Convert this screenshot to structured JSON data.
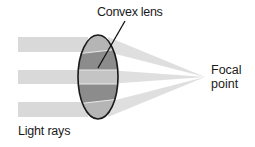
{
  "diagram": {
    "type": "optics-convex-lens",
    "labels": {
      "lens": "Convex lens",
      "focal_line1": "Focal",
      "focal_line2": "point",
      "rays": "Light rays"
    },
    "colors": {
      "ray": "#d9d9d9",
      "lens_outline": "#1a1a1a",
      "lens_dark": "#8c8c8c",
      "lens_mid": "#a6a6a6",
      "lens_light": "#c4c4c4",
      "background": "#ffffff"
    },
    "rays": [
      {
        "name": "top",
        "y_top": 37,
        "y_bottom": 52
      },
      {
        "name": "middle",
        "y_top": 70,
        "y_bottom": 84
      },
      {
        "name": "bottom",
        "y_top": 102,
        "y_bottom": 117
      }
    ],
    "focal_point": {
      "x": 205,
      "y": 77
    }
  }
}
